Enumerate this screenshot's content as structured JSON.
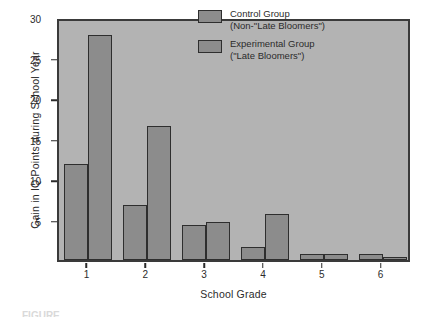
{
  "chart_data": {
    "type": "bar",
    "title": "",
    "xlabel": "School Grade",
    "ylabel": "Gain in IQ Points during School Year",
    "categories": [
      "1",
      "2",
      "3",
      "4",
      "5",
      "6"
    ],
    "series": [
      {
        "name": "Control Group (Non-\"Late Bloomers\")",
        "values": [
          11.8,
          6.8,
          4.3,
          1.6,
          0.7,
          0.8
        ]
      },
      {
        "name": "Experimental Group (\"Late Bloomers\")",
        "values": [
          27.8,
          16.6,
          4.7,
          5.7,
          0.8,
          0.4
        ]
      }
    ],
    "ylim": [
      0,
      30
    ],
    "yticks": [
      5,
      10,
      15,
      20,
      25,
      30
    ],
    "ytick_labels": [
      "5",
      "10",
      "15",
      "20",
      "25",
      "30"
    ],
    "grid": false,
    "legend_position": "top-right",
    "bar_fill_color": "#8c8c8c",
    "bar_edge_color": "#2e2e2e",
    "plot_background_color": "#b3b3b3",
    "figure_background_color": "#ffffff"
  },
  "legend": {
    "entries": [
      {
        "line1": "Control Group",
        "line2": "(Non-\"Late Bloomers\")"
      },
      {
        "line1": "Experimental Group",
        "line2": "(\"Late Bloomers\")"
      }
    ]
  },
  "caption": {
    "text": "FIGURE"
  }
}
